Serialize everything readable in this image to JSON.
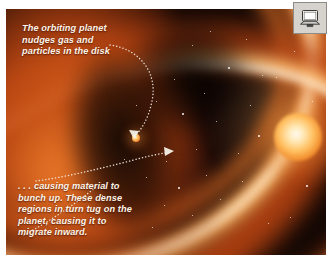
{
  "scene": {
    "title": "Protoplanetary disk planet migration illustration",
    "captions": {
      "top": "The orbiting planet nudges gas and particles in the disk",
      "bottom": ". . . causing material to bunch up. These dense regions in turn tug on the planet, causing it to migrate inward."
    },
    "objects": {
      "star_label": "central-star",
      "planet_label": "orbiting-planet",
      "disk_label": "protoplanetary-disk"
    }
  },
  "badge": {
    "icon": "computer-icon",
    "panel_color": "#d6d3ce"
  },
  "colors": {
    "disk_bright": "#ffba6e",
    "disk_hot": "#fff4e2",
    "disk_mid": "#e1661e",
    "disk_deep": "#ba4614",
    "space": "#0b0402",
    "star_core": "#fffaf0",
    "planet": "#ffc66a",
    "caption_text": "#fdf4e8",
    "arrow": "#f2ece2"
  },
  "starfield": [
    {
      "x": 186,
      "y": 36,
      "big": false
    },
    {
      "x": 204,
      "y": 22,
      "big": false
    },
    {
      "x": 222,
      "y": 58,
      "big": true
    },
    {
      "x": 240,
      "y": 30,
      "big": false
    },
    {
      "x": 256,
      "y": 66,
      "big": false
    },
    {
      "x": 198,
      "y": 84,
      "big": false
    },
    {
      "x": 168,
      "y": 70,
      "big": false
    },
    {
      "x": 176,
      "y": 104,
      "big": true
    },
    {
      "x": 150,
      "y": 92,
      "big": false
    },
    {
      "x": 210,
      "y": 112,
      "big": false
    },
    {
      "x": 244,
      "y": 96,
      "big": false
    },
    {
      "x": 252,
      "y": 126,
      "big": true
    },
    {
      "x": 232,
      "y": 144,
      "big": false
    },
    {
      "x": 190,
      "y": 140,
      "big": false
    },
    {
      "x": 160,
      "y": 152,
      "big": false
    },
    {
      "x": 140,
      "y": 168,
      "big": false
    },
    {
      "x": 172,
      "y": 178,
      "big": true
    },
    {
      "x": 200,
      "y": 166,
      "big": false
    },
    {
      "x": 214,
      "y": 190,
      "big": false
    },
    {
      "x": 186,
      "y": 206,
      "big": false
    },
    {
      "x": 158,
      "y": 196,
      "big": false
    },
    {
      "x": 236,
      "y": 172,
      "big": false
    },
    {
      "x": 270,
      "y": 68,
      "big": false
    },
    {
      "x": 288,
      "y": 42,
      "big": false
    },
    {
      "x": 300,
      "y": 176,
      "big": true
    },
    {
      "x": 284,
      "y": 208,
      "big": false
    },
    {
      "x": 262,
      "y": 214,
      "big": false
    },
    {
      "x": 306,
      "y": 92,
      "big": false
    },
    {
      "x": 130,
      "y": 96,
      "big": false
    },
    {
      "x": 118,
      "y": 150,
      "big": false
    },
    {
      "x": 146,
      "y": 218,
      "big": false
    },
    {
      "x": 96,
      "y": 186,
      "big": false
    }
  ]
}
